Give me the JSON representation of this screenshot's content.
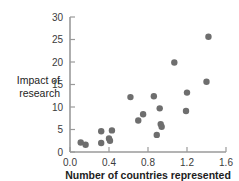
{
  "chart_data": {
    "type": "scatter",
    "title": "",
    "xlabel": "Number of countries represented",
    "ylabel": "Impact of research",
    "ylabel_lines": [
      "Impact of",
      "research"
    ],
    "xlim": [
      0.0,
      1.6
    ],
    "ylim": [
      0,
      30
    ],
    "xticks": [
      0.0,
      0.4,
      0.8,
      1.2,
      1.6
    ],
    "xtick_labels": [
      "0.0",
      "0.4",
      "0.8",
      "1.2",
      "1.6"
    ],
    "yticks": [
      0,
      5,
      10,
      15,
      20,
      25,
      30
    ],
    "ytick_labels": [
      "0",
      "5",
      "10",
      "15",
      "20",
      "25",
      "30"
    ],
    "grid": false,
    "legend": null,
    "marker_color": "#6e6e6e",
    "marker_size": 3.2,
    "points": [
      {
        "x": 0.11,
        "y": 2.1
      },
      {
        "x": 0.16,
        "y": 1.6
      },
      {
        "x": 0.32,
        "y": 4.6
      },
      {
        "x": 0.32,
        "y": 2.0
      },
      {
        "x": 0.4,
        "y": 3.0
      },
      {
        "x": 0.41,
        "y": 2.5
      },
      {
        "x": 0.43,
        "y": 4.8
      },
      {
        "x": 0.62,
        "y": 12.2
      },
      {
        "x": 0.7,
        "y": 7.0
      },
      {
        "x": 0.75,
        "y": 8.4
      },
      {
        "x": 0.86,
        "y": 12.4
      },
      {
        "x": 0.89,
        "y": 3.8
      },
      {
        "x": 0.92,
        "y": 9.7
      },
      {
        "x": 0.93,
        "y": 6.2
      },
      {
        "x": 0.94,
        "y": 5.6
      },
      {
        "x": 1.07,
        "y": 19.9
      },
      {
        "x": 1.19,
        "y": 9.1
      },
      {
        "x": 1.2,
        "y": 13.2
      },
      {
        "x": 1.4,
        "y": 15.6
      },
      {
        "x": 1.42,
        "y": 25.6
      }
    ]
  },
  "axis_color": "#9a9a9a",
  "text_color": "#1d1d1d"
}
